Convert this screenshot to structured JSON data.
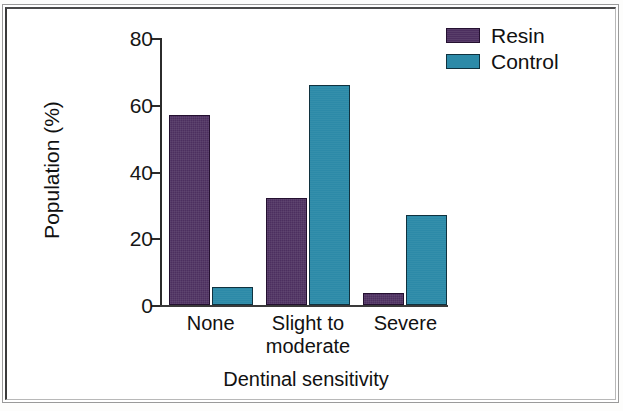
{
  "chart_data": {
    "type": "bar",
    "title": "",
    "xlabel": "Dentinal sensitivity",
    "ylabel": "Population (%)",
    "categories": [
      "None",
      "Slight to moderate",
      "Severe"
    ],
    "category_lines": [
      [
        "None"
      ],
      [
        "Slight to",
        "moderate"
      ],
      [
        "Severe"
      ]
    ],
    "series": [
      {
        "name": "Resin",
        "color": "#4c2f5f",
        "values": [
          57,
          32,
          3.5
        ]
      },
      {
        "name": "Control",
        "color": "#2c8aa8",
        "values": [
          5.5,
          66,
          27
        ]
      }
    ],
    "ylim": [
      0,
      80
    ],
    "yticks": [
      0,
      20,
      40,
      60,
      80
    ],
    "ytick_labels": [
      "0",
      "20",
      "40",
      "60",
      "80"
    ],
    "grid": false,
    "legend_position": "top-right",
    "legend_entries": [
      "Resin",
      "Control"
    ]
  },
  "axes": {
    "y_title": "Population (%)",
    "x_title": "Dentinal sensitivity"
  },
  "legend": {
    "items": [
      {
        "label": "Resin",
        "swatch": "resin-swatch-icon"
      },
      {
        "label": "Control",
        "swatch": "control-swatch-icon"
      }
    ]
  }
}
